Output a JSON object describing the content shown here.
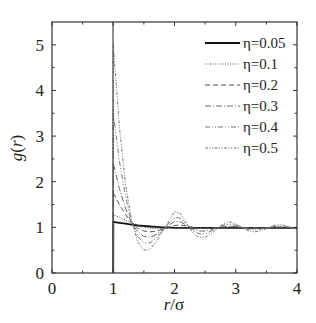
{
  "chart_data": {
    "type": "line",
    "title": "",
    "xlabel": "r/σ",
    "ylabel": "g(r)",
    "xlim": [
      0,
      4
    ],
    "ylim": [
      0,
      5.5
    ],
    "xticks": [
      "0",
      "1",
      "2",
      "3",
      "4"
    ],
    "yticks": [
      "0",
      "1",
      "2",
      "3",
      "4",
      "5"
    ],
    "grid": false,
    "legend_position": "upper right",
    "x": [
      1.0,
      1.1,
      1.2,
      1.3,
      1.4,
      1.5,
      1.6,
      1.7,
      1.8,
      1.9,
      2.0,
      2.1,
      2.2,
      2.3,
      2.4,
      2.5,
      2.6,
      2.7,
      2.8,
      2.9,
      3.0,
      3.1,
      3.2,
      3.3,
      3.4,
      3.5,
      3.6,
      3.7,
      3.8,
      3.9,
      4.0
    ],
    "series": [
      {
        "name": "η=0.05",
        "style": "solid",
        "values": [
          1.12,
          1.1,
          1.08,
          1.06,
          1.04,
          1.03,
          1.02,
          1.01,
          1.0,
          1.0,
          0.99,
          0.99,
          0.99,
          0.99,
          0.99,
          0.99,
          0.99,
          0.99,
          0.99,
          0.99,
          0.99,
          0.99,
          0.99,
          0.99,
          0.99,
          0.99,
          0.99,
          0.99,
          0.99,
          0.99,
          0.99
        ]
      },
      {
        "name": "η=0.1",
        "style": "dotted",
        "values": [
          1.28,
          1.22,
          1.16,
          1.1,
          1.05,
          1.01,
          0.98,
          0.97,
          0.97,
          0.98,
          0.99,
          1.0,
          1.0,
          1.0,
          1.0,
          0.99,
          0.99,
          0.99,
          0.99,
          0.99,
          0.99,
          0.99,
          0.99,
          0.99,
          0.99,
          0.99,
          0.99,
          0.99,
          0.99,
          0.99,
          0.99
        ]
      },
      {
        "name": "η=0.2",
        "style": "dashed",
        "values": [
          1.75,
          1.5,
          1.28,
          1.1,
          0.98,
          0.92,
          0.9,
          0.92,
          0.96,
          1.0,
          1.04,
          1.05,
          1.03,
          1.0,
          0.98,
          0.97,
          0.98,
          0.99,
          1.0,
          1.01,
          1.01,
          1.0,
          0.99,
          0.99,
          0.99,
          0.99,
          1.0,
          1.0,
          1.0,
          0.99,
          0.99
        ]
      },
      {
        "name": "η=0.3",
        "style": "dash-dot",
        "values": [
          2.4,
          1.85,
          1.42,
          1.1,
          0.9,
          0.8,
          0.78,
          0.84,
          0.94,
          1.04,
          1.13,
          1.12,
          1.04,
          0.96,
          0.92,
          0.92,
          0.95,
          0.99,
          1.02,
          1.03,
          1.02,
          1.0,
          0.98,
          0.98,
          0.98,
          0.99,
          1.0,
          1.01,
          1.01,
          1.0,
          0.99
        ]
      },
      {
        "name": "η=0.4",
        "style": "dash-dot-dot",
        "values": [
          3.5,
          2.45,
          1.68,
          1.12,
          0.8,
          0.66,
          0.66,
          0.76,
          0.92,
          1.08,
          1.22,
          1.2,
          1.06,
          0.93,
          0.86,
          0.86,
          0.92,
          0.99,
          1.05,
          1.07,
          1.05,
          1.0,
          0.96,
          0.95,
          0.96,
          0.99,
          1.02,
          1.03,
          1.02,
          1.0,
          0.98
        ]
      },
      {
        "name": "η=0.5",
        "style": "dash-dot-dot-dense",
        "values": [
          5.0,
          3.2,
          1.95,
          1.15,
          0.68,
          0.5,
          0.52,
          0.68,
          0.9,
          1.12,
          1.35,
          1.3,
          1.08,
          0.88,
          0.78,
          0.78,
          0.86,
          0.98,
          1.08,
          1.12,
          1.08,
          1.0,
          0.93,
          0.9,
          0.92,
          0.97,
          1.03,
          1.06,
          1.04,
          1.0,
          0.96
        ]
      }
    ]
  }
}
